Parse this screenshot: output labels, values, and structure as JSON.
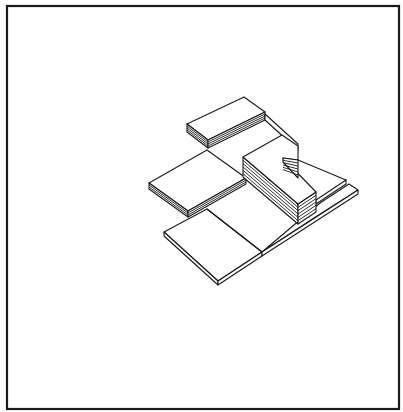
{
  "figure": {
    "type": "isometric-line-drawing",
    "stroke_color": "#1a1a1a",
    "background": "#ffffff",
    "frame": {
      "x": 7,
      "y": 6,
      "width": 392,
      "height": 403
    }
  },
  "shapes": {
    "bottom_slab": {
      "top": "164,232 207,209 262,252 218,281",
      "side_left": "164,232 164,236 218,285 218,281",
      "side_right": "218,281 218,285 262,256 262,252",
      "divider": "207,209 262,252"
    },
    "right_lower_step": {
      "top": "262,252 314,218 358,190 349,184 320,203",
      "front": "262,252 262,256 358,194 358,190"
    },
    "right_upper_step": {
      "top": "316,200 346,180 346,184 316,204",
      "ledge": "298,160 346,180"
    },
    "big_slab": {
      "top": "149,183 207,150 246,178 188,211",
      "side_left": "149,183 149,189 188,217 188,211",
      "side_right": "188,211 188,217 246,184 246,178",
      "layers": [
        "149,185 188,213 246,180",
        "149,187 188,215 246,182"
      ]
    },
    "back_top_block": {
      "top": "187,124 244,97 265,112 208,140",
      "side_left": "187,124 187,132 208,148 208,140",
      "side_right": "208,140 208,148 265,120 265,112",
      "layers": [
        "187,126 208,142 265,114",
        "187,128 208,144 265,116",
        "187,130 208,146 265,118"
      ]
    },
    "back_right_strip": {
      "top": "265,114 298,144 298,150 265,120"
    },
    "l_block": {
      "top": "243,157 282,135 298,146 298,160 283,158 316,192 298,204 243,157",
      "front_left": "243,157 243,177 298,224 298,204",
      "front_right": "298,204 298,224 316,212 316,192",
      "notch_left": "283,158 283,162",
      "layers_count": 6
    }
  }
}
